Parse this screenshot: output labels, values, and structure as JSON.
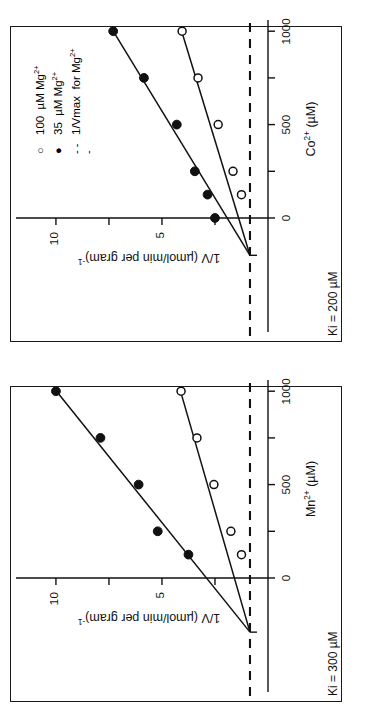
{
  "figure": {
    "kind": "two-panel Dixon plot",
    "background_color": "#ffffff",
    "ink_color": "#111111"
  },
  "legend": {
    "entries": [
      {
        "marker": "open-circle",
        "label": "100 µM Mg",
        "sup": "2+"
      },
      {
        "marker": "filled-circle",
        "label": "35 µM Mg",
        "sup": "2+"
      },
      {
        "marker": "dashed-line",
        "label": "1/Vmax for Mg",
        "sup": "2+"
      }
    ],
    "line1_pre": "100",
    "line1_unit": "µM  Mg",
    "line2_pre": "35",
    "line2_unit": "µM  Mg",
    "line3_pre": "1/Vmax",
    "line3_unit": "for  Mg",
    "sup": "2+",
    "open_glyph": "○",
    "filled_glyph": "●",
    "dash_glyph": "- - -"
  },
  "panels": [
    {
      "id": "co",
      "ki_label": "Ki = 200  µM",
      "x_axis": {
        "label_main": "Co",
        "label_sup": "2+",
        "label_unit": "(µM)",
        "ticks": [
          0,
          250,
          500,
          750,
          1000
        ],
        "tick_labels": [
          "0",
          "",
          "500",
          "",
          "1000"
        ],
        "min": -300,
        "max": 1060
      },
      "y_axis": {
        "label": "1/V  (µmol/min per gram)",
        "label_sup": "-1",
        "ticks": [
          2.5,
          5,
          7.5,
          10
        ],
        "tick_labels": [
          "",
          "5",
          "",
          "10"
        ],
        "min": 0,
        "max": 11.6
      },
      "vmax_line_y": 0.85
    },
    {
      "id": "mn",
      "ki_label": "Ki = 300  µM",
      "x_axis": {
        "label_main": "Mn",
        "label_sup": "2+",
        "label_unit": "(µM)",
        "ticks": [
          0,
          250,
          500,
          750,
          1000
        ],
        "tick_labels": [
          "0",
          "",
          "500",
          "",
          "1000"
        ],
        "min": -300,
        "max": 1060
      },
      "y_axis": {
        "label": "1/V  (µmol/min per gram)",
        "label_sup": "-1",
        "ticks": [
          2.5,
          5,
          7.5,
          10
        ],
        "tick_labels": [
          "",
          "5",
          "",
          "10"
        ],
        "min": 0,
        "max": 11.6
      },
      "vmax_line_y": 0.85
    }
  ],
  "chart_data": [
    {
      "type": "scatter",
      "id": "co-dixon",
      "title": "Dixon plot — Co2+ inhibition",
      "xlabel": "Co2+ (µM)",
      "ylabel": "1/V (µmol/min per gram)-1",
      "xlim": [
        -300,
        1060
      ],
      "ylim": [
        0,
        11.6
      ],
      "grid": false,
      "annotations": [
        "Ki = 200 µM"
      ],
      "legend_position": "top-left",
      "series": [
        {
          "name": "35 µM Mg2+",
          "marker": "filled-circle",
          "x": [
            0,
            125,
            250,
            500,
            750,
            1000
          ],
          "y": [
            2.5,
            2.85,
            3.45,
            4.3,
            5.85,
            7.3
          ],
          "fit_line": {
            "x0": -200,
            "y0": 0.85,
            "x1": 1010,
            "y1": 7.35
          }
        },
        {
          "name": "100 µM Mg2+",
          "marker": "open-circle",
          "x": [
            125,
            250,
            500,
            750,
            1000
          ],
          "y": [
            1.25,
            1.65,
            2.35,
            3.3,
            4.05
          ],
          "fit_line": {
            "x0": -200,
            "y0": 0.85,
            "x1": 1010,
            "y1": 4.1
          }
        }
      ],
      "reference_line": {
        "name": "1/Vmax for Mg2+",
        "style": "dashed",
        "y": 0.85
      }
    },
    {
      "type": "scatter",
      "id": "mn-dixon",
      "title": "Dixon plot — Mn2+ inhibition",
      "xlabel": "Mn2+ (µM)",
      "ylabel": "1/V (µmol/min per gram)-1",
      "xlim": [
        -300,
        1060
      ],
      "ylim": [
        0,
        11.6
      ],
      "grid": false,
      "annotations": [
        "Ki = 300 µM"
      ],
      "legend_position": "none",
      "series": [
        {
          "name": "35 µM Mg2+",
          "marker": "filled-circle",
          "x": [
            125,
            250,
            500,
            750,
            1000
          ],
          "y": [
            3.75,
            5.2,
            6.1,
            7.9,
            10.0
          ],
          "fit_line": {
            "x0": -290,
            "y0": 0.85,
            "x1": 1010,
            "y1": 10.05
          }
        },
        {
          "name": "100 µM Mg2+",
          "marker": "open-circle",
          "x": [
            125,
            250,
            500,
            750,
            1000
          ],
          "y": [
            1.25,
            1.75,
            2.55,
            3.35,
            4.1
          ],
          "fit_line": {
            "x0": -290,
            "y0": 0.85,
            "x1": 1010,
            "y1": 4.15
          }
        }
      ],
      "reference_line": {
        "name": "1/Vmax for Mg2+",
        "style": "dashed",
        "y": 0.85
      }
    }
  ]
}
